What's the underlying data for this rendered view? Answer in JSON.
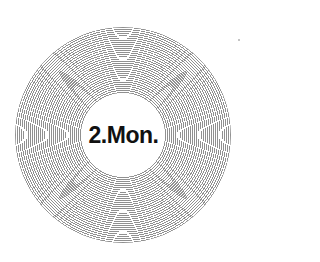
{
  "figure": {
    "center_label": "2.Mon.",
    "ring_color": "#8a8a8a",
    "background_color": "#ffffff",
    "text_color": "#111111"
  }
}
